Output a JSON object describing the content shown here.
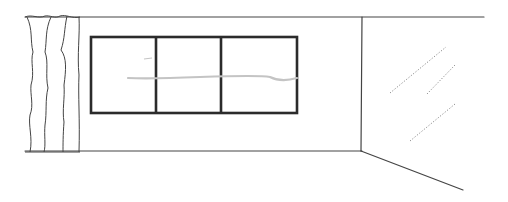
{
  "scene": {
    "description": "Line sketch of a room interior with a curtain, a three-pane window, a wall corner and a glass panel",
    "width": 508,
    "height": 202,
    "colors": {
      "background": "#ffffff",
      "line": "#444444",
      "window_frame": "#2b2b2b",
      "pencil_mark": "#c4c4c4",
      "dotted": "#8a8a8a"
    },
    "wall": {
      "top_line": [
        [
          25,
          17
        ],
        [
          484,
          17
        ]
      ],
      "bottom_line": [
        [
          25,
          151
        ],
        [
          362,
          151
        ]
      ],
      "corner_vertical": [
        [
          362,
          17
        ],
        [
          361,
          151
        ]
      ],
      "floor_diagonal": [
        [
          361,
          151
        ],
        [
          463,
          190
        ]
      ]
    },
    "window": {
      "x": 91,
      "y": 37,
      "width": 206,
      "height": 76,
      "dividers_x": [
        156,
        221
      ],
      "stroke_width": 2.6
    },
    "pencil_line": "M128,78 C150,79 175,78 200,77 C230,76 260,75 270,77 C280,82 290,80 297,78",
    "pencil_tick": "M144,59 L152,58",
    "curtain_folds": [
      "M27,17 C33,30 30,40 33,52 C30,62 35,72 31,85 C30,95 34,105 30,115 C28,125 33,138 30,152",
      "M51,17 C45,30 47,40 45,52 C49,62 45,75 48,88 C45,100 47,112 45,125 C44,135 46,145 44,152",
      "M67,16 C64,30 65,38 61,50 C67,58 66,70 64,85 C65,98 62,110 64,122 C63,135 63,145 63,152",
      "M79,17 C80,35 77,55 79,75 C78,95 80,120 79,152"
    ],
    "curtain_top": "M25,17 C32,14 38,19 45,16 C50,15 55,19 60,16 C66,14 72,19 80,17",
    "glass_reflections": [
      [
        [
          390,
          93
        ],
        [
          446,
          47
        ]
      ],
      [
        [
          427,
          94
        ],
        [
          455,
          65
        ]
      ],
      [
        [
          410,
          141
        ],
        [
          455,
          104
        ]
      ]
    ]
  }
}
